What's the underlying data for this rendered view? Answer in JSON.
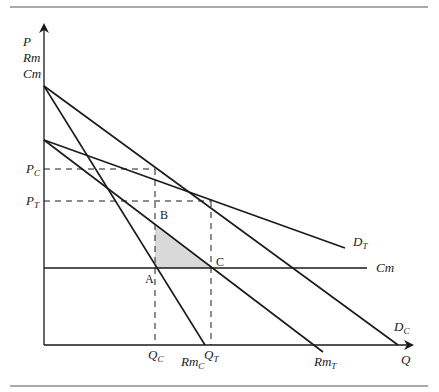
{
  "axes": {
    "y_label_lines": [
      "P",
      "Rm",
      "Cm"
    ],
    "x_label": "Q"
  },
  "price_levels": [
    {
      "base": "P",
      "sub": "C"
    },
    {
      "base": "P",
      "sub": "T"
    }
  ],
  "quantity_levels": [
    {
      "base": "Q",
      "sub": "C"
    },
    {
      "base": "Q",
      "sub": "T"
    }
  ],
  "curves": {
    "demand_c": {
      "base": "D",
      "sub": "C"
    },
    "demand_t": {
      "base": "D",
      "sub": "T"
    },
    "mr_c": {
      "base": "Rm",
      "sub": "C"
    },
    "mr_t": {
      "base": "Rm",
      "sub": "T"
    },
    "mc": {
      "base": "Cm"
    }
  },
  "points": {
    "a": "A",
    "b": "B",
    "c": "C"
  },
  "colors": {
    "line": "#1a1a1a",
    "shaded_area": "#d9d9d9",
    "rule": "#555555"
  }
}
